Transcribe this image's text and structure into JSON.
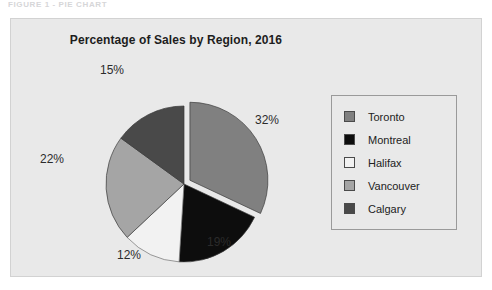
{
  "caption": {
    "text": "FIGURE 1 - PIE CHART"
  },
  "chart_data": {
    "type": "pie",
    "title": "Percentage of Sales by Region, 2016",
    "xlabel": "",
    "ylabel": "",
    "legend_position": "right",
    "grid": false,
    "categories": [
      "Toronto",
      "Montreal",
      "Halifax",
      "Vancouver",
      "Calgary"
    ],
    "values": [
      32,
      19,
      12,
      22,
      15
    ],
    "value_labels": [
      "32%",
      "19%",
      "12%",
      "22%",
      "15%"
    ],
    "colors": [
      "#808080",
      "#0d0d0d",
      "#f2f2f2",
      "#a5a5a5",
      "#494949"
    ],
    "exploded": [
      "Toronto"
    ],
    "start_angle_deg": 0,
    "direction": "clockwise",
    "slices": [
      {
        "name": "Toronto",
        "value": 32,
        "label": "32%",
        "color": "#808080",
        "exploded": true
      },
      {
        "name": "Montreal",
        "value": 19,
        "label": "19%",
        "color": "#0d0d0d",
        "exploded": false
      },
      {
        "name": "Halifax",
        "value": 12,
        "label": "12%",
        "color": "#f2f2f2",
        "exploded": false
      },
      {
        "name": "Vancouver",
        "value": 22,
        "label": "22%",
        "color": "#a5a5a5",
        "exploded": false
      },
      {
        "name": "Calgary",
        "value": 15,
        "label": "15%",
        "color": "#494949",
        "exploded": false
      }
    ]
  },
  "legend": {
    "items": [
      {
        "label": "Toronto",
        "color": "#808080"
      },
      {
        "label": "Montreal",
        "color": "#0d0d0d"
      },
      {
        "label": "Halifax",
        "color": "#f2f2f2"
      },
      {
        "label": "Vancouver",
        "color": "#a5a5a5"
      },
      {
        "label": "Calgary",
        "color": "#494949"
      }
    ]
  },
  "labels": {
    "toronto_pct": "32%",
    "montreal_pct": "19%",
    "halifax_pct": "12%",
    "vancouver_pct": "22%",
    "calgary_pct": "15%"
  }
}
